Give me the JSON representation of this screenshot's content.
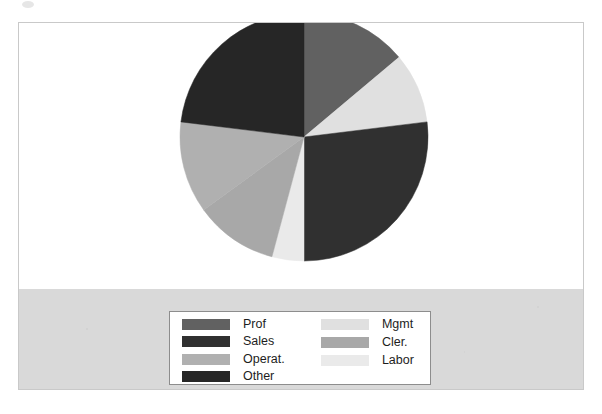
{
  "figure": {
    "background_color": "#ffffff",
    "frame_border_color": "#c9c9c9",
    "band_color": "#d9d9d9"
  },
  "legend": {
    "border_color": "#8d8d8d",
    "background_color": "#ffffff",
    "columns": [
      {
        "entries": [
          {
            "label": "Prof",
            "color": "#616161"
          },
          {
            "label": "Sales",
            "color": "#303030"
          },
          {
            "label": "Operat.",
            "color": "#b0b0b0"
          },
          {
            "label": "Other",
            "color": "#262626"
          }
        ]
      },
      {
        "entries": [
          {
            "label": "Mgmt",
            "color": "#e0e0e0"
          },
          {
            "label": "Cler.",
            "color": "#a8a8a8"
          },
          {
            "label": "Labor",
            "color": "#eaeaea"
          }
        ]
      }
    ]
  },
  "chart_data": {
    "type": "pie",
    "title": "",
    "legend_position": "bottom",
    "start_angle_deg": 90,
    "direction": "clockwise",
    "center": {
      "cx": 126,
      "cy": 126
    },
    "radius": 124,
    "labels": [
      "Prof",
      "Mgmt",
      "Sales",
      "Labor",
      "Cler.",
      "Operat.",
      "Other"
    ],
    "values": [
      14,
      9,
      27,
      4,
      11,
      12,
      23
    ],
    "colors": [
      "#616161",
      "#e0e0e0",
      "#303030",
      "#eaeaea",
      "#a8a8a8",
      "#b0b0b0",
      "#262626"
    ],
    "slices": [
      {
        "label": "Prof",
        "value": 14,
        "color": "#616161",
        "start_deg": 0,
        "end_deg": 50
      },
      {
        "label": "Mgmt",
        "value": 9,
        "color": "#e0e0e0",
        "start_deg": 50,
        "end_deg": 83
      },
      {
        "label": "Sales",
        "value": 27,
        "color": "#303030",
        "start_deg": 83,
        "end_deg": 180
      },
      {
        "label": "Labor",
        "value": 4,
        "color": "#eaeaea",
        "start_deg": 180,
        "end_deg": 195
      },
      {
        "label": "Cler.",
        "value": 11,
        "color": "#a8a8a8",
        "start_deg": 195,
        "end_deg": 234
      },
      {
        "label": "Operat.",
        "value": 12,
        "color": "#b0b0b0",
        "start_deg": 234,
        "end_deg": 277
      },
      {
        "label": "Other",
        "value": 23,
        "color": "#262626",
        "start_deg": 277,
        "end_deg": 360
      }
    ]
  }
}
